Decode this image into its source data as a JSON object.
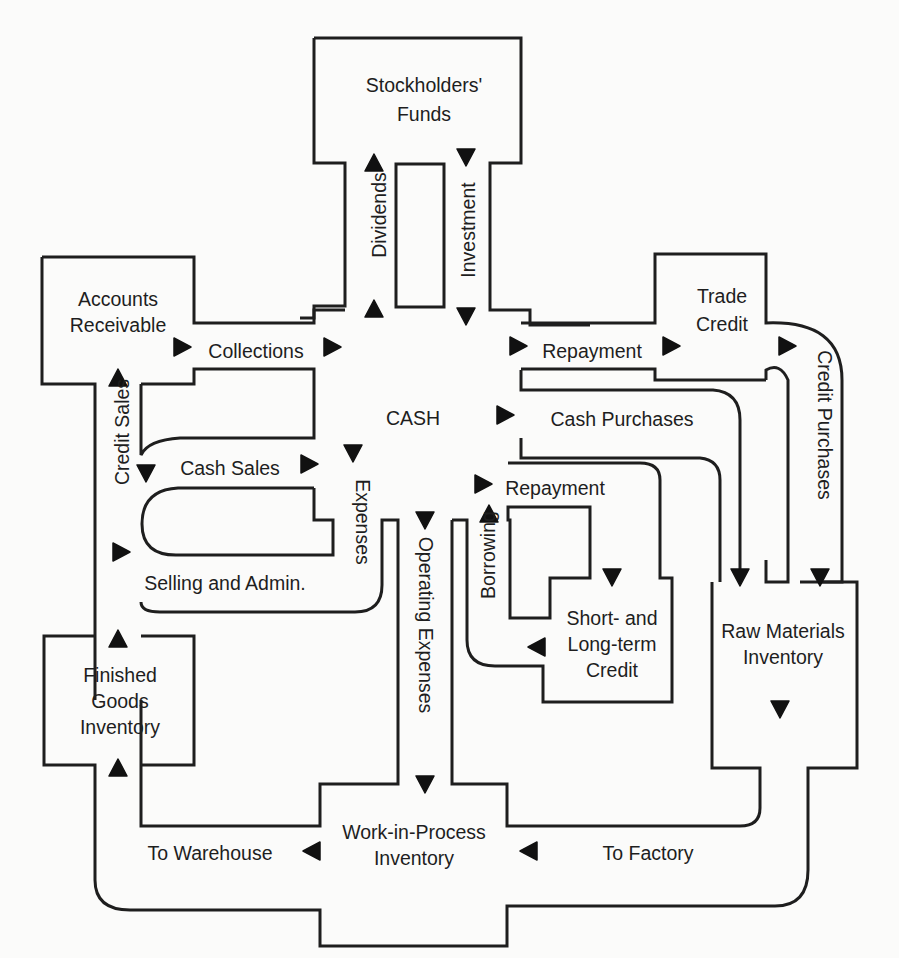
{
  "colors": {
    "ink": "#1e1e1e",
    "paper": "#fbfbfa"
  },
  "nodes": {
    "cash": {
      "label": "CASH",
      "x": 413,
      "y": 420
    },
    "stockholders": {
      "lines": [
        "Stockholders'",
        "Funds"
      ],
      "x": 424,
      "y": [
        92,
        121
      ]
    },
    "accounts_receivable": {
      "lines": [
        "Accounts",
        "Receivable"
      ],
      "x": 118,
      "y": [
        306,
        332
      ]
    },
    "trade_credit": {
      "lines": [
        "Trade",
        "Credit"
      ],
      "x": 722,
      "y": [
        303,
        331
      ]
    },
    "short_long_credit": {
      "lines": [
        "Short- and",
        "Long-term",
        "Credit"
      ],
      "x": 612,
      "y": [
        625,
        651,
        677
      ]
    },
    "raw_materials": {
      "lines": [
        "Raw Materials",
        "Inventory"
      ],
      "x": 783,
      "y": [
        638,
        664
      ]
    },
    "finished_goods": {
      "lines": [
        "Finished",
        "Goods",
        "Inventory"
      ],
      "x": 120,
      "y": [
        682,
        708,
        734
      ]
    },
    "work_in_process": {
      "lines": [
        "Work-in-Process",
        "Inventory"
      ],
      "x": 414,
      "y": [
        839,
        865
      ]
    }
  },
  "flows": {
    "dividends": {
      "label": "Dividends",
      "x": 381,
      "y": 215,
      "rotate": -90
    },
    "investment": {
      "label": "Investment",
      "x": 470,
      "y": 230,
      "rotate": -90
    },
    "collections": {
      "label": "Collections",
      "x": 256,
      "y": 353
    },
    "repayment_trade": {
      "label": "Repayment",
      "x": 592,
      "y": 353
    },
    "cash_purchases": {
      "label": "Cash Purchases",
      "x": 622,
      "y": 421
    },
    "credit_sales": {
      "label": "Credit Sales",
      "x": 124,
      "y": 432,
      "rotate": -90
    },
    "cash_sales": {
      "label": "Cash Sales",
      "x": 230,
      "y": 470
    },
    "expenses": {
      "label": "Expenses",
      "x": 361,
      "y": 522,
      "rotate": 90
    },
    "selling_admin": {
      "label": "Selling and Admin.",
      "x": 225,
      "y": 585
    },
    "repayment_credit": {
      "label": "Repayment",
      "x": 555,
      "y": 490
    },
    "borrowing": {
      "label": "Borrowing",
      "x": 490,
      "y": 555,
      "rotate": -90
    },
    "operating_expenses": {
      "label": "Operating Expenses",
      "x": 424,
      "y": 625,
      "rotate": 90
    },
    "credit_purchases": {
      "label": "Credit Purchases",
      "x": 823,
      "y": 425,
      "rotate": 90
    },
    "to_warehouse": {
      "label": "To Warehouse",
      "x": 210,
      "y": 855
    },
    "to_factory": {
      "label": "To Factory",
      "x": 648,
      "y": 855
    }
  },
  "arrows": [
    {
      "id": "dividends-top",
      "dir": "up",
      "x": 374,
      "y": 163
    },
    {
      "id": "dividends-bottom",
      "dir": "up",
      "x": 374,
      "y": 309
    },
    {
      "id": "investment-top",
      "dir": "down",
      "x": 466,
      "y": 157
    },
    {
      "id": "investment-bottom",
      "dir": "down",
      "x": 466,
      "y": 316
    },
    {
      "id": "collections-left",
      "dir": "right",
      "x": 182,
      "y": 347
    },
    {
      "id": "collections-right",
      "dir": "right",
      "x": 332,
      "y": 347
    },
    {
      "id": "repayment-trade-left",
      "dir": "right",
      "x": 518,
      "y": 346
    },
    {
      "id": "repayment-trade-right",
      "dir": "right",
      "x": 671,
      "y": 346
    },
    {
      "id": "trade-credit-out",
      "dir": "right",
      "x": 787,
      "y": 346
    },
    {
      "id": "cash-purchases-in",
      "dir": "right",
      "x": 505,
      "y": 415
    },
    {
      "id": "credit-sales-top",
      "dir": "up",
      "x": 118,
      "y": 378
    },
    {
      "id": "credit-sales-bottom",
      "dir": "right",
      "x": 121,
      "y": 552
    },
    {
      "id": "cash-sales-left",
      "dir": "down",
      "x": 146,
      "y": 473
    },
    {
      "id": "cash-sales-right",
      "dir": "right",
      "x": 309,
      "y": 464
    },
    {
      "id": "expenses-top",
      "dir": "down",
      "x": 353,
      "y": 453
    },
    {
      "id": "repayment-credit-in",
      "dir": "right",
      "x": 483,
      "y": 484
    },
    {
      "id": "borrowing-up",
      "dir": "up",
      "x": 489,
      "y": 514
    },
    {
      "id": "opex-top",
      "dir": "down",
      "x": 425,
      "y": 520
    },
    {
      "id": "opex-bottom",
      "dir": "down",
      "x": 425,
      "y": 784
    },
    {
      "id": "credit-store-down",
      "dir": "down",
      "x": 612,
      "y": 577
    },
    {
      "id": "credit-store-left",
      "dir": "left",
      "x": 537,
      "y": 647
    },
    {
      "id": "raw-cash-down",
      "dir": "down",
      "x": 740,
      "y": 577
    },
    {
      "id": "raw-credit-down",
      "dir": "down",
      "x": 820,
      "y": 577
    },
    {
      "id": "raw-out-down",
      "dir": "down",
      "x": 780,
      "y": 709
    },
    {
      "id": "finished-top",
      "dir": "up",
      "x": 118,
      "y": 639
    },
    {
      "id": "finished-bottom",
      "dir": "up",
      "x": 118,
      "y": 768
    },
    {
      "id": "to-warehouse-arrow",
      "dir": "left",
      "x": 312,
      "y": 851
    },
    {
      "id": "to-factory-arrow",
      "dir": "left",
      "x": 529,
      "y": 851
    }
  ]
}
